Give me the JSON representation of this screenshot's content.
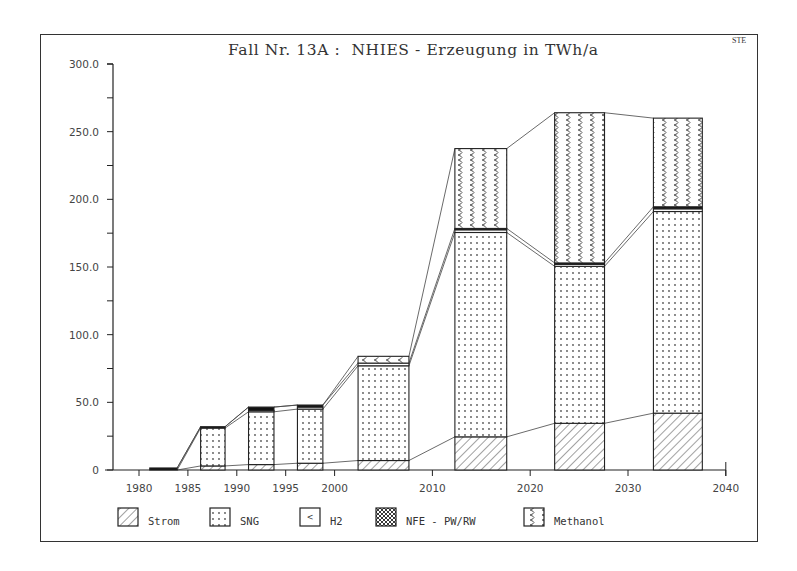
{
  "chart": {
    "title": "Fall Nr. 13A :  NHIES - Erzeugung in TWh/a",
    "tag": "STE"
  },
  "chart_data": {
    "type": "bar",
    "stacked": true,
    "title": "Fall Nr. 13A :  NHIES - Erzeugung in TWh/a",
    "xlabel": "",
    "ylabel": "TWh/a",
    "ylim": [
      0,
      300
    ],
    "xlim": [
      1977,
      2040
    ],
    "y_ticks": [
      "0",
      "50.0",
      "100.0",
      "150.0",
      "200.0",
      "250.0",
      "300.0"
    ],
    "y_tick_values": [
      0,
      50,
      100,
      150,
      200,
      250,
      300
    ],
    "x_ticks": [
      "1980",
      "1985",
      "1990",
      "1995",
      "2000",
      "2010",
      "2020",
      "2030",
      "2040"
    ],
    "x_tick_values": [
      1980,
      1985,
      1990,
      1995,
      2000,
      2010,
      2020,
      2030,
      2040
    ],
    "grid": false,
    "legend_position": "bottom",
    "categories": [
      "1982",
      "1987",
      "1992",
      "1997",
      "2005",
      "2015",
      "2025",
      "2035"
    ],
    "bar_spans": [
      [
        1981.1,
        1983.9
      ],
      [
        1986.3,
        1988.8
      ],
      [
        1991.2,
        1993.8
      ],
      [
        1996.2,
        1998.8
      ],
      [
        2002.4,
        2007.6
      ],
      [
        2012.3,
        2017.6
      ],
      [
        2022.5,
        2027.6
      ],
      [
        2032.6,
        2037.6
      ]
    ],
    "series": [
      {
        "name": "Strom",
        "pattern": "hatch",
        "values": [
          0,
          3,
          4,
          5,
          7,
          24.5,
          34.5,
          42
        ]
      },
      {
        "name": "SNG",
        "pattern": "dots",
        "values": [
          0,
          28,
          39,
          40,
          70,
          151,
          116,
          149
        ]
      },
      {
        "name": "H2",
        "pattern": "blank",
        "values": [
          0,
          0,
          1,
          1.5,
          2,
          2,
          1.5,
          2
        ]
      },
      {
        "name": "NFE - PW/RW",
        "pattern": "crosshatch",
        "values": [
          1.5,
          1,
          2.5,
          1.5,
          0,
          1,
          1,
          1.5
        ]
      },
      {
        "name": "Methanol",
        "pattern": "wave",
        "values": [
          0,
          0,
          0,
          0,
          5,
          59,
          111,
          65.5
        ]
      }
    ],
    "totals": [
      1.5,
      32,
      46.5,
      48,
      84,
      237.5,
      264,
      260
    ]
  },
  "legend": {
    "items": [
      {
        "label": "Strom",
        "icon": "hatch-swatch-icon"
      },
      {
        "label": "SNG",
        "icon": "dots-swatch-icon"
      },
      {
        "label": "H2",
        "icon": "blank-swatch-icon"
      },
      {
        "label": "NFE - PW/RW",
        "icon": "crosshatch-swatch-icon"
      },
      {
        "label": "Methanol",
        "icon": "wave-swatch-icon"
      }
    ]
  },
  "colors": {
    "ink": "#222222",
    "background": "#ffffff"
  }
}
